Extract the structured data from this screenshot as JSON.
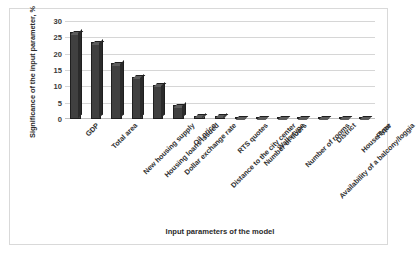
{
  "chart_data": {
    "type": "bar",
    "title": "",
    "subtitle": "",
    "xlabel": "Input parameters of the model",
    "ylabel": "Significance of the input parameter, %",
    "ylim": [
      0,
      30
    ],
    "ytick_values": [
      30,
      25,
      20,
      15,
      10,
      5,
      0
    ],
    "ytick_labels": [
      "30",
      "25",
      "20",
      "15",
      "10",
      "5",
      "0"
    ],
    "grid": true,
    "grid_axis": "y",
    "legend": false,
    "legend_position": "none",
    "bar_style": "3d-column",
    "bar_color": "#404040",
    "bar_top_color": "#5c5c5c",
    "bar_side_color": "#2b2b2b",
    "gridline_color": "#d6d6d6",
    "frame_color": "#d9d9d9",
    "background_color": "#ffffff",
    "categories": [
      "GDP",
      "Total area",
      "New housing supply",
      "Housing loans issued",
      "Dollar exchange rate",
      "Oil price",
      "Distance to the city center",
      "RTS quotes",
      "Number of floors",
      "Walls type",
      "Number of rooms",
      "Availability of a balcony/loggia",
      "District",
      "House type",
      "Floor"
    ],
    "values": [
      26.5,
      23.5,
      17,
      13,
      10.5,
      4.2,
      1.0,
      1.0,
      0.5,
      0.4,
      0.4,
      0.4,
      0.4,
      0.4,
      0.4
    ],
    "series": [
      {
        "name": "Significance of the input parameter, %",
        "values": [
          26.5,
          23.5,
          17,
          13,
          10.5,
          4.2,
          1.0,
          1.0,
          0.5,
          0.4,
          0.4,
          0.4,
          0.4,
          0.4,
          0.4
        ]
      }
    ]
  }
}
